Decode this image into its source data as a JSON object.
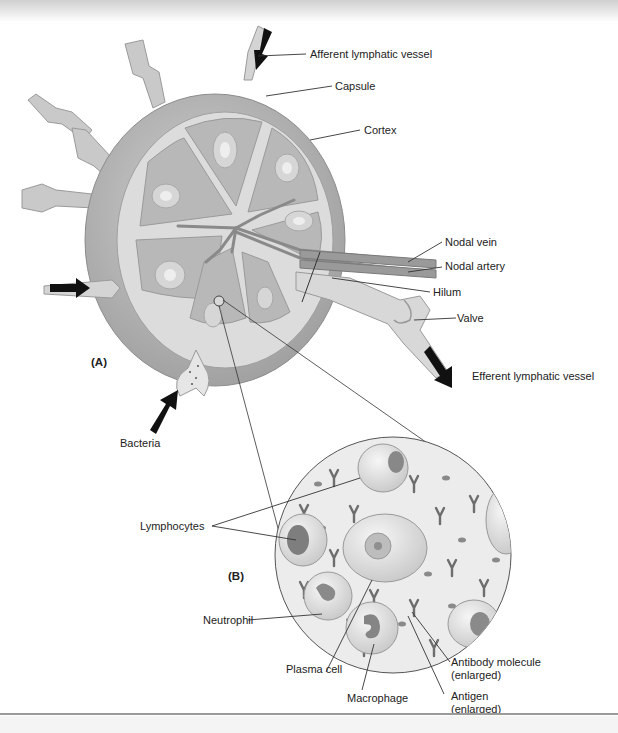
{
  "figure": {
    "panel_a_label": "(A)",
    "panel_b_label": "(B)",
    "colors": {
      "capsule": "#a9a9a9",
      "cortex": "#c4c4c4",
      "lobule": "#b4b4b4",
      "trabecula": "#e2e2e2",
      "arrow": "#111111",
      "leader_line": "#333333",
      "magnified_bg": "#ececec"
    }
  },
  "labels_a": {
    "afferent": "Afferent lymphatic vessel",
    "capsule": "Capsule",
    "cortex": "Cortex",
    "nodal_vein": "Nodal vein",
    "nodal_artery": "Nodal artery",
    "hilum": "Hilum",
    "valve": "Valve",
    "efferent": "Efferent lymphatic vessel",
    "bacteria": "Bacteria"
  },
  "labels_b": {
    "lymphocytes": "Lymphocytes",
    "neutrophil": "Neutrophil",
    "plasma_cell": "Plasma cell",
    "macrophage": "Macrophage",
    "antibody_line1": "Antibody molecule",
    "antibody_line2": "(enlarged)",
    "antigen_line1": "Antigen",
    "antigen_line2": "(enlarged)"
  }
}
